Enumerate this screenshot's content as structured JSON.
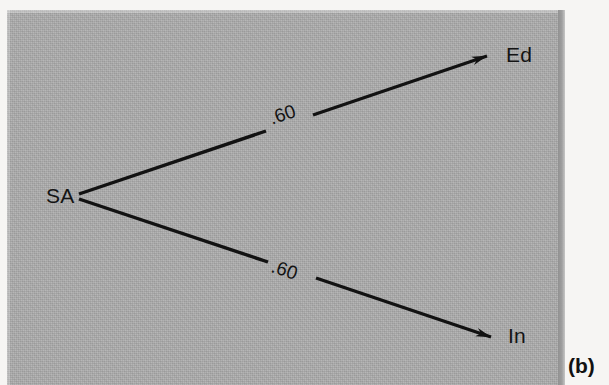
{
  "figure": {
    "caption": "(b)",
    "panel_color": "#adadad",
    "page_color": "#f6f5f3",
    "ink_color": "#121212"
  },
  "diagram": {
    "type": "path-diagram",
    "nodes": [
      {
        "id": "SA",
        "label": "SA",
        "x": 77,
        "y": 196,
        "role": "source"
      },
      {
        "id": "Ed",
        "label": "Ed",
        "x": 508,
        "y": 57,
        "role": "target"
      },
      {
        "id": "In",
        "label": "In",
        "x": 510,
        "y": 338,
        "role": "target"
      }
    ],
    "edges": [
      {
        "id": "sa-to-ed",
        "from": "SA",
        "to": "Ed",
        "label": ".60",
        "coefficient": 0.6,
        "arrow": "single-headed",
        "label_rotation_deg": -18.5
      },
      {
        "id": "sa-to-in",
        "from": "SA",
        "to": "In",
        "label": ".60",
        "coefficient": 0.6,
        "arrow": "single-headed",
        "label_rotation_deg": 18.5
      }
    ]
  }
}
